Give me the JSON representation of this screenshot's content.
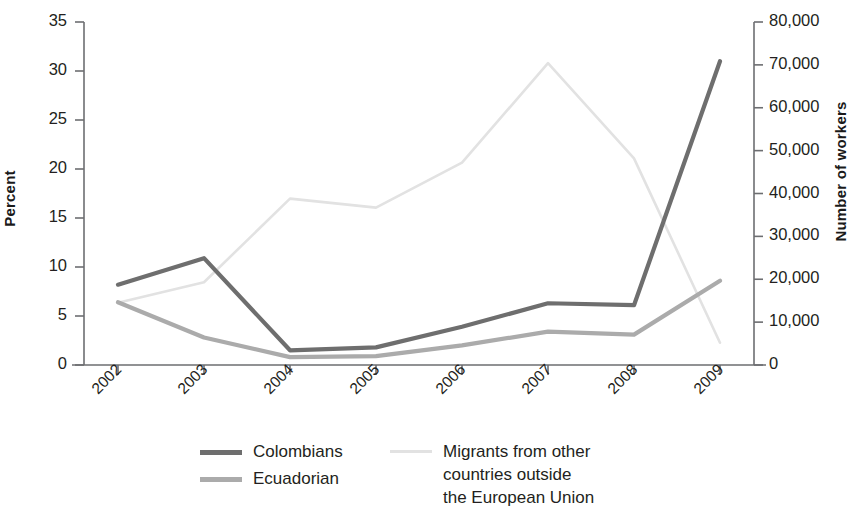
{
  "chart_data": {
    "type": "line",
    "title": "",
    "xlabel": "",
    "categories": [
      "2002",
      "2003",
      "2004",
      "2005",
      "2006",
      "2007",
      "2008",
      "2009"
    ],
    "left_axis": {
      "label": "Percent",
      "ticks": [
        "0",
        "5",
        "10",
        "15",
        "20",
        "25",
        "30",
        "35"
      ],
      "tick_values": [
        0,
        5,
        10,
        15,
        20,
        25,
        30,
        35
      ],
      "ylim": [
        0,
        35
      ]
    },
    "right_axis": {
      "label": "Number of workers",
      "ticks": [
        "0",
        "10,000",
        "20,000",
        "30,000",
        "40,000",
        "50,000",
        "60,000",
        "70,000",
        "80,000"
      ],
      "tick_values": [
        0,
        10000,
        20000,
        30000,
        40000,
        50000,
        60000,
        70000,
        80000
      ],
      "ylim": [
        0,
        80000
      ]
    },
    "grid": false,
    "legend_position": "bottom",
    "series": [
      {
        "name": "Colombians",
        "axis": "left",
        "unit": "percent",
        "color": "#6e6e6e",
        "values": [
          8.2,
          10.9,
          1.5,
          1.8,
          3.9,
          6.3,
          6.1,
          31.0
        ]
      },
      {
        "name": "Ecuadorian",
        "axis": "left",
        "unit": "percent",
        "color": "#ababab",
        "values": [
          6.4,
          2.8,
          0.8,
          0.9,
          2.0,
          3.4,
          3.1,
          8.6
        ]
      },
      {
        "name": "Migrants from other\ncountries outside\nthe European Union",
        "axis": "right",
        "unit": "workers",
        "color": "#e2e2e2",
        "values": [
          14500,
          19300,
          38800,
          36700,
          47200,
          70400,
          48200,
          5200
        ]
      }
    ]
  },
  "legend": {
    "entries": [
      {
        "label": "Colombians",
        "color": "#6e6e6e"
      },
      {
        "label": "Ecuadorian",
        "color": "#ababab"
      },
      {
        "label": "Migrants from other\ncountries outside\nthe European Union",
        "color": "#e2e2e2"
      }
    ]
  }
}
